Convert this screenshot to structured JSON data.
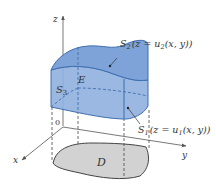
{
  "figure": {
    "axes": {
      "z_label": "z",
      "x_label": "x",
      "y_label": "y",
      "origin_label": "0"
    },
    "solid_label": "E",
    "region_label": "D",
    "surfaces": {
      "top": {
        "name": "S",
        "sub": "2",
        "eq_pre": "(z = u",
        "eq_sub": "2",
        "eq_post": "(x, y))"
      },
      "bottom": {
        "name": "S",
        "sub": "1",
        "eq_pre": "(z = u",
        "eq_sub": "1",
        "eq_post": "(x, y))"
      },
      "side": {
        "name": "S",
        "sub": "3"
      }
    },
    "colors": {
      "solid_fill": "#8fb0de",
      "solid_top": "#7ea3d8",
      "edge": "#3f6fb0",
      "region_fill": "#d2d2d2",
      "axis": "#555555"
    }
  }
}
